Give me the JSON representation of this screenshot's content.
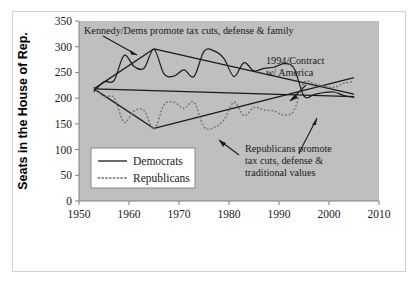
{
  "chart_data": {
    "type": "line",
    "title": "",
    "xlabel": "",
    "ylabel": "Seats in the House of Rep.",
    "xlim": [
      1950,
      2010
    ],
    "ylim": [
      0,
      350
    ],
    "xticks": [
      "1950",
      "1960",
      "1970",
      "1980",
      "1990",
      "2000",
      "2010"
    ],
    "yticks": [
      "0",
      "50",
      "100",
      "150",
      "200",
      "250",
      "300",
      "350"
    ],
    "grid": false,
    "legend_position": "lower-left-inside",
    "series": [
      {
        "name": "Democrats",
        "style": "solid",
        "color": "#1a1a1a",
        "x": [
          1953,
          1955,
          1957,
          1959,
          1961,
          1963,
          1965,
          1967,
          1969,
          1971,
          1973,
          1975,
          1977,
          1979,
          1981,
          1983,
          1985,
          1987,
          1989,
          1991,
          1993,
          1995,
          1997,
          1999,
          2001,
          2003,
          2005
        ],
        "values": [
          213,
          232,
          234,
          283,
          262,
          258,
          295,
          247,
          243,
          255,
          242,
          291,
          292,
          277,
          242,
          269,
          253,
          258,
          260,
          267,
          258,
          204,
          207,
          211,
          212,
          205,
          202
        ]
      },
      {
        "name": "Republicans",
        "style": "dotted",
        "color": "#707070",
        "x": [
          1953,
          1955,
          1957,
          1959,
          1961,
          1963,
          1965,
          1967,
          1969,
          1971,
          1973,
          1975,
          1977,
          1979,
          1981,
          1983,
          1985,
          1987,
          1989,
          1991,
          1993,
          1995,
          1997,
          1999,
          2001,
          2003,
          2005
        ],
        "values": [
          221,
          203,
          201,
          153,
          175,
          176,
          140,
          187,
          192,
          180,
          192,
          144,
          143,
          158,
          192,
          166,
          182,
          177,
          175,
          167,
          176,
          230,
          228,
          223,
          221,
          229,
          232
        ]
      }
    ],
    "trendlines": [
      {
        "name": "democrat-trend-down",
        "x": [
          1953,
          2005
        ],
        "values": [
          218,
          203
        ],
        "style": "solid"
      },
      {
        "name": "democrat-trend-up",
        "x": [
          1953,
          1965
        ],
        "values": [
          218,
          296
        ],
        "style": "solid"
      },
      {
        "name": "democrat-trend-peak-down",
        "x": [
          1965,
          2005
        ],
        "values": [
          296,
          208
        ],
        "style": "solid"
      },
      {
        "name": "republican-trend-down",
        "x": [
          1953,
          1965
        ],
        "values": [
          218,
          141
        ],
        "style": "solid"
      },
      {
        "name": "republican-trend-up",
        "x": [
          1965,
          2005
        ],
        "values": [
          141,
          240
        ],
        "style": "solid"
      }
    ],
    "annotations": [
      {
        "id": "kennedy-annotation",
        "lines": [
          "Kennedy/Dems promote tax cuts, defense & family"
        ],
        "text": "Kennedy/Dems promote tax cuts, defense & family"
      },
      {
        "id": "contract-annotation",
        "lines": [
          "1994/Contract",
          "w/ America"
        ],
        "text": "1994/Contract w/ America"
      },
      {
        "id": "republicans-annotation",
        "lines": [
          "Republicans promote",
          "tax cuts, defense &",
          "traditional values"
        ],
        "text": "Republicans promote tax cuts, defense & traditional values"
      }
    ],
    "legend": [
      {
        "label": "Democrats",
        "style": "solid"
      },
      {
        "label": "Republicans",
        "style": "dotted"
      }
    ],
    "colors": {
      "plot_background": "#bfbfbf",
      "figure_background": "#ffffff",
      "democrat_line": "#1a1a1a",
      "republican_line": "#707070",
      "axis": "#808080",
      "text": "#1a1a1a"
    }
  }
}
